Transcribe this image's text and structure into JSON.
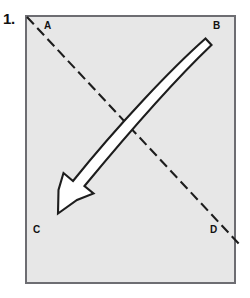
{
  "figure": {
    "step_number": "1.",
    "caption": "",
    "paper": {
      "name": "square-paper-sheet",
      "fill_color": "#e7e7e7",
      "border_color": "#6d6d72",
      "x": 25,
      "y": 15,
      "width": 211,
      "height": 269
    },
    "corner_labels": [
      {
        "id": "A",
        "text": "A",
        "x": 44,
        "y": 21,
        "corner": "top-left"
      },
      {
        "id": "B",
        "text": "B",
        "x": 213,
        "y": 21,
        "corner": "top-right"
      },
      {
        "id": "C",
        "text": "C",
        "x": 33,
        "y": 225,
        "corner": "bottom-left"
      },
      {
        "id": "D",
        "text": "D",
        "x": 210,
        "y": 225,
        "corner": "bottom-right"
      }
    ],
    "fold_line": {
      "name": "diagonal-fold-crease",
      "style": "dashed",
      "color": "#1d1d1d",
      "stroke_width": 2,
      "dash_pattern": "10 5",
      "from": {
        "x": 27,
        "y": 17
      },
      "to": {
        "x": 240,
        "y": 245
      },
      "description": "dashed diagonal crease from corner A to beyond corner D"
    },
    "fold_arrow": {
      "name": "fold-direction-arrow",
      "fill_color": "#ffffff",
      "outline_color": "#1d1d1d",
      "stroke_width": 2,
      "curved": true,
      "tail": {
        "x": 206,
        "y": 42
      },
      "tip": {
        "x": 56,
        "y": 212
      },
      "direction": "from corner B toward corner C",
      "description": "curved white arrow with black outline indicating the fold motion"
    }
  },
  "colors": {
    "page_background": "#ffffff",
    "paper_fill": "#e7e7e7",
    "paper_border": "#6d6d72",
    "ink": "#1d1d1d",
    "arrow_fill": "#ffffff"
  }
}
